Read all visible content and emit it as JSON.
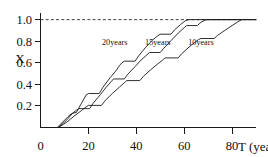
{
  "chart_data": {
    "type": "line",
    "title": "",
    "subtitle": "",
    "xlabel": "T (year)",
    "ylabel": "X",
    "xlim": [
      0,
      90
    ],
    "ylim": [
      0,
      1.08
    ],
    "xticks": [
      0,
      20,
      40,
      60,
      80
    ],
    "xtick_labels": [
      "0",
      "20",
      "40",
      "60",
      "80"
    ],
    "yticks": [
      0.2,
      0.4,
      0.6,
      0.8,
      1.0
    ],
    "ytick_labels": [
      "0.2",
      "0.4",
      "0.6",
      "0.8",
      "1.0"
    ],
    "grid": false,
    "legend_position": "inline-labels",
    "annotations": [
      {
        "text": "20years",
        "x": 31,
        "y": 0.79
      },
      {
        "text": "15years",
        "x": 49,
        "y": 0.79
      },
      {
        "text": "10years",
        "x": 67,
        "y": 0.79
      }
    ],
    "reference_lines": [
      {
        "orientation": "horizontal",
        "value": 1.0,
        "style": "dashed",
        "label": ""
      }
    ],
    "series": [
      {
        "name": "20years",
        "label": "20years",
        "color": "#1a1a1a",
        "points": [
          [
            7.0,
            0.0
          ],
          [
            11.5,
            0.1
          ],
          [
            13.0,
            0.13
          ],
          [
            15.0,
            0.14
          ],
          [
            17.0,
            0.22
          ],
          [
            19.0,
            0.3
          ],
          [
            20.0,
            0.315
          ],
          [
            24.5,
            0.315
          ],
          [
            26.0,
            0.37
          ],
          [
            29.0,
            0.46
          ],
          [
            31.5,
            0.525
          ],
          [
            33.0,
            0.575
          ],
          [
            34.0,
            0.6
          ],
          [
            35.0,
            0.615
          ],
          [
            39.5,
            0.615
          ],
          [
            41.0,
            0.665
          ],
          [
            44.0,
            0.745
          ],
          [
            47.0,
            0.815
          ],
          [
            49.0,
            0.85
          ],
          [
            50.0,
            0.865
          ],
          [
            54.5,
            0.865
          ],
          [
            56.0,
            0.905
          ],
          [
            58.5,
            0.955
          ],
          [
            60.5,
            0.99
          ],
          [
            62.0,
            1.0
          ],
          [
            90.0,
            1.0
          ]
        ]
      },
      {
        "name": "15years",
        "label": "15years",
        "color": "#1a1a1a",
        "points": [
          [
            7.5,
            0.0
          ],
          [
            11.0,
            0.07
          ],
          [
            13.5,
            0.135
          ],
          [
            15.0,
            0.16
          ],
          [
            16.0,
            0.175
          ],
          [
            20.5,
            0.175
          ],
          [
            22.0,
            0.225
          ],
          [
            25.0,
            0.305
          ],
          [
            27.5,
            0.375
          ],
          [
            29.5,
            0.425
          ],
          [
            30.5,
            0.45
          ],
          [
            35.0,
            0.45
          ],
          [
            36.5,
            0.495
          ],
          [
            39.5,
            0.565
          ],
          [
            42.0,
            0.625
          ],
          [
            44.5,
            0.675
          ],
          [
            45.5,
            0.695
          ],
          [
            50.0,
            0.695
          ],
          [
            51.5,
            0.735
          ],
          [
            54.5,
            0.805
          ],
          [
            57.5,
            0.875
          ],
          [
            60.0,
            0.925
          ],
          [
            61.0,
            0.945
          ],
          [
            65.5,
            0.945
          ],
          [
            67.0,
            0.975
          ],
          [
            69.0,
            0.998
          ],
          [
            70.5,
            1.0
          ],
          [
            90.0,
            1.0
          ]
        ]
      },
      {
        "name": "10years",
        "label": "10years",
        "color": "#1a1a1a",
        "points": [
          [
            7.5,
            0.0
          ],
          [
            11.0,
            0.05
          ],
          [
            14.0,
            0.105
          ],
          [
            17.0,
            0.155
          ],
          [
            19.0,
            0.19
          ],
          [
            20.0,
            0.205
          ],
          [
            25.5,
            0.205
          ],
          [
            27.0,
            0.25
          ],
          [
            30.0,
            0.315
          ],
          [
            33.0,
            0.375
          ],
          [
            35.0,
            0.415
          ],
          [
            36.0,
            0.435
          ],
          [
            41.5,
            0.435
          ],
          [
            43.0,
            0.475
          ],
          [
            46.0,
            0.535
          ],
          [
            49.0,
            0.59
          ],
          [
            51.0,
            0.625
          ],
          [
            52.0,
            0.645
          ],
          [
            57.5,
            0.645
          ],
          [
            59.0,
            0.685
          ],
          [
            62.0,
            0.745
          ],
          [
            64.5,
            0.79
          ],
          [
            66.0,
            0.815
          ],
          [
            67.0,
            0.825
          ],
          [
            72.5,
            0.825
          ],
          [
            74.0,
            0.855
          ],
          [
            77.0,
            0.9
          ],
          [
            80.0,
            0.945
          ],
          [
            82.5,
            0.98
          ],
          [
            84.0,
            1.0
          ]
        ]
      }
    ]
  },
  "axes": {
    "y_title": "X",
    "x_title": "T (year)"
  }
}
